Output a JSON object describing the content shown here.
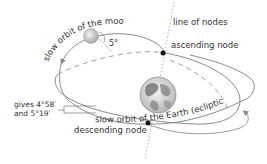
{
  "diagram": {
    "labels": {
      "moon_orbit": "slow orbit of the moon",
      "line_of_nodes": "line of nodes",
      "ascending_node": "ascending node",
      "descending_node": "descending node",
      "earth_orbit": "slow orbit of the Earth (ecliptic",
      "angle": "5°",
      "gives_line1": "gives 4°58′",
      "gives_line2": "and 5°19′"
    },
    "colors": {
      "orbit_line": "#8a8a8a",
      "dashed_line": "#9a9a9a",
      "node_dot": "#111111",
      "text": "#333333",
      "moon": "#c8c8c8",
      "earth_ocean": "#dcdcdc",
      "earth_land": "#6a6a6a"
    }
  }
}
